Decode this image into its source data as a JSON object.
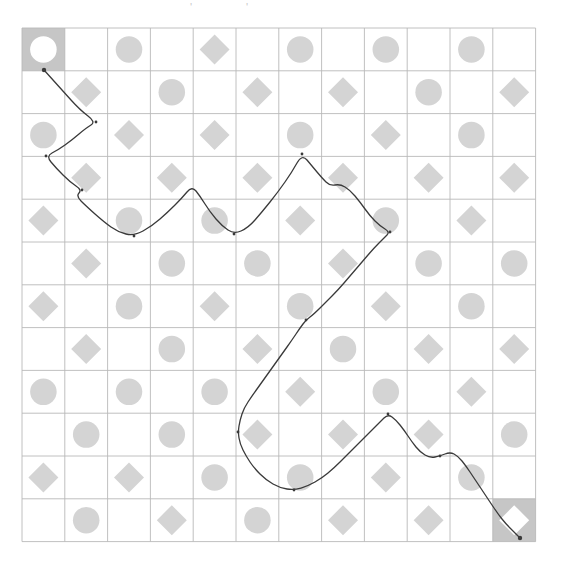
{
  "page": {
    "background_color": "#ffffff",
    "width": 562,
    "height": 585
  },
  "artifacts": [
    {
      "name": "stray-mark-left",
      "glyph": "'",
      "x": 190,
      "y": 2
    },
    {
      "name": "stray-mark-right",
      "glyph": "'",
      "x": 246,
      "y": 2
    }
  ],
  "grid": {
    "name": "shape-grid",
    "origin_x": 22,
    "origin_y": 28,
    "cell_size": 42.8,
    "rows": 12,
    "cols": 12,
    "line_color": "#b9b9b9",
    "line_width": 0.9,
    "shape_fill": "#d4d4d4",
    "highlight_cell_fill": "#c6c6c6",
    "highlight_shape_fill": "#ffffff",
    "shape_scale": 0.62,
    "legend": {
      "empty": "",
      "circle": "circle",
      "diamond": "diamond"
    },
    "cells": [
      [
        "circle",
        "",
        "circle",
        "",
        "diamond",
        "",
        "circle",
        "",
        "circle",
        "",
        "circle",
        ""
      ],
      [
        "",
        "diamond",
        "",
        "circle",
        "",
        "diamond",
        "",
        "diamond",
        "",
        "circle",
        "",
        "diamond"
      ],
      [
        "circle",
        "",
        "diamond",
        "",
        "diamond",
        "",
        "circle",
        "",
        "diamond",
        "",
        "circle",
        ""
      ],
      [
        "",
        "diamond",
        "",
        "diamond",
        "",
        "diamond",
        "",
        "diamond",
        "",
        "diamond",
        "",
        "diamond"
      ],
      [
        "diamond",
        "",
        "circle",
        "",
        "circle",
        "",
        "diamond",
        "",
        "circle",
        "",
        "diamond",
        ""
      ],
      [
        "",
        "diamond",
        "",
        "circle",
        "",
        "circle",
        "",
        "diamond",
        "",
        "circle",
        "",
        "circle"
      ],
      [
        "diamond",
        "",
        "circle",
        "",
        "diamond",
        "",
        "circle",
        "",
        "diamond",
        "",
        "circle",
        ""
      ],
      [
        "",
        "diamond",
        "",
        "circle",
        "",
        "diamond",
        "",
        "circle",
        "",
        "diamond",
        "",
        "diamond"
      ],
      [
        "circle",
        "",
        "circle",
        "",
        "circle",
        "",
        "diamond",
        "",
        "circle",
        "",
        "diamond",
        ""
      ],
      [
        "",
        "circle",
        "",
        "circle",
        "",
        "diamond",
        "",
        "diamond",
        "",
        "diamond",
        "",
        "circle"
      ],
      [
        "diamond",
        "",
        "diamond",
        "",
        "circle",
        "",
        "circle",
        "",
        "diamond",
        "",
        "circle",
        ""
      ],
      [
        "",
        "circle",
        "",
        "diamond",
        "",
        "circle",
        "",
        "diamond",
        "",
        "diamond",
        "",
        "diamond"
      ]
    ],
    "start_cell": {
      "name": "start-cell",
      "row": 0,
      "col": 0,
      "shape": "circle"
    },
    "end_cell": {
      "name": "end-cell",
      "row": 11,
      "col": 11,
      "shape": "diamond"
    }
  },
  "path": {
    "name": "drawn-path",
    "stroke_color": "#3a3a3a",
    "stroke_width": 1.3,
    "points": [
      [
        44,
        70
      ],
      [
        62,
        90
      ],
      [
        80,
        110
      ],
      [
        96,
        122
      ],
      [
        86,
        128
      ],
      [
        72,
        140
      ],
      [
        58,
        150
      ],
      [
        46,
        156
      ],
      [
        56,
        168
      ],
      [
        70,
        182
      ],
      [
        82,
        190
      ],
      [
        76,
        196
      ],
      [
        86,
        206
      ],
      [
        104,
        222
      ],
      [
        118,
        232
      ],
      [
        134,
        236
      ],
      [
        152,
        226
      ],
      [
        168,
        212
      ],
      [
        182,
        198
      ],
      [
        192,
        186
      ],
      [
        200,
        196
      ],
      [
        210,
        212
      ],
      [
        222,
        226
      ],
      [
        234,
        234
      ],
      [
        248,
        228
      ],
      [
        262,
        212
      ],
      [
        278,
        192
      ],
      [
        292,
        172
      ],
      [
        302,
        154
      ],
      [
        312,
        166
      ],
      [
        322,
        178
      ],
      [
        330,
        186
      ],
      [
        340,
        184
      ],
      [
        350,
        190
      ],
      [
        360,
        202
      ],
      [
        370,
        216
      ],
      [
        380,
        226
      ],
      [
        390,
        232
      ],
      [
        384,
        238
      ],
      [
        374,
        248
      ],
      [
        362,
        262
      ],
      [
        350,
        276
      ],
      [
        338,
        290
      ],
      [
        326,
        302
      ],
      [
        314,
        314
      ],
      [
        306,
        320
      ],
      [
        300,
        328
      ],
      [
        292,
        340
      ],
      [
        282,
        354
      ],
      [
        272,
        368
      ],
      [
        262,
        382
      ],
      [
        252,
        396
      ],
      [
        244,
        408
      ],
      [
        240,
        420
      ],
      [
        238,
        432
      ],
      [
        240,
        444
      ],
      [
        246,
        456
      ],
      [
        254,
        468
      ],
      [
        266,
        480
      ],
      [
        280,
        488
      ],
      [
        294,
        490
      ],
      [
        308,
        486
      ],
      [
        322,
        478
      ],
      [
        334,
        468
      ],
      [
        346,
        456
      ],
      [
        358,
        444
      ],
      [
        370,
        432
      ],
      [
        380,
        422
      ],
      [
        388,
        414
      ],
      [
        396,
        420
      ],
      [
        404,
        430
      ],
      [
        412,
        442
      ],
      [
        420,
        452
      ],
      [
        430,
        458
      ],
      [
        440,
        456
      ],
      [
        450,
        452
      ],
      [
        458,
        456
      ],
      [
        466,
        466
      ],
      [
        474,
        478
      ],
      [
        482,
        490
      ],
      [
        490,
        502
      ],
      [
        498,
        514
      ],
      [
        506,
        524
      ],
      [
        514,
        532
      ],
      [
        520,
        538
      ]
    ],
    "start_marker": {
      "name": "path-start-marker",
      "x": 44,
      "y": 70,
      "r": 2.2
    },
    "end_marker": {
      "name": "path-end-marker",
      "x": 520,
      "y": 538,
      "r": 2.2
    },
    "waypoint_markers": [
      {
        "name": "waypoint-marker",
        "x": 96,
        "y": 122
      },
      {
        "name": "waypoint-marker",
        "x": 46,
        "y": 156
      },
      {
        "name": "waypoint-marker",
        "x": 82,
        "y": 190
      },
      {
        "name": "waypoint-marker",
        "x": 134,
        "y": 236
      },
      {
        "name": "waypoint-marker",
        "x": 234,
        "y": 234
      },
      {
        "name": "waypoint-marker",
        "x": 302,
        "y": 154
      },
      {
        "name": "waypoint-marker",
        "x": 390,
        "y": 232
      },
      {
        "name": "waypoint-marker",
        "x": 306,
        "y": 320
      },
      {
        "name": "waypoint-marker",
        "x": 238,
        "y": 432
      },
      {
        "name": "waypoint-marker",
        "x": 294,
        "y": 490
      },
      {
        "name": "waypoint-marker",
        "x": 388,
        "y": 414
      },
      {
        "name": "waypoint-marker",
        "x": 440,
        "y": 456
      }
    ]
  }
}
